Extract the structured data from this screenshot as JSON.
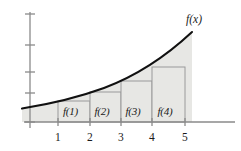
{
  "figure": {
    "curve_label": "f(x)",
    "colors": {
      "fill": "#e7e7e4",
      "curve": "#111111",
      "axis": "#8a8a8a",
      "rect_border": "#9a9a9a",
      "text": "#1a1a1a",
      "background": "#ffffff"
    }
  },
  "axes": {
    "x_axis": {
      "y_px": 122,
      "x_start_px": 24,
      "x_end_px": 235
    },
    "y_axis": {
      "x_px": 30,
      "y_start_px": 12,
      "y_end_px": 128
    },
    "x_ticks": [
      {
        "label": "1",
        "x_px": 58
      },
      {
        "label": "2",
        "x_px": 90
      },
      {
        "label": "3",
        "x_px": 121
      },
      {
        "label": "4",
        "x_px": 152
      },
      {
        "label": "5",
        "x_px": 185
      }
    ],
    "y_ticks_px": [
      14,
      45,
      72,
      93,
      122
    ]
  },
  "rectangles": [
    {
      "label": "f(1)",
      "x_left_px": 58,
      "x_right_px": 90,
      "top_px": 101
    },
    {
      "label": "f(2)",
      "x_left_px": 90,
      "x_right_px": 121,
      "top_px": 92
    },
    {
      "label": "f(3)",
      "x_left_px": 121,
      "x_right_px": 152,
      "top_px": 81
    },
    {
      "label": "f(4)",
      "x_left_px": 152,
      "x_right_px": 185,
      "top_px": 67
    }
  ],
  "chart_data": {
    "type": "area",
    "xlabel": "",
    "ylabel": "",
    "xlim": [
      0,
      5.8
    ],
    "ylim": [
      0,
      5
    ],
    "grid": false,
    "legend": "none",
    "annotations": [
      "f(x)"
    ],
    "x_tick_labels": [
      "1",
      "2",
      "3",
      "4",
      "5"
    ],
    "y_tick_labels": [
      "",
      "",
      "",
      "",
      ""
    ],
    "categories": [
      "f(1)",
      "f(2)",
      "f(3)",
      "f(4)"
    ],
    "bar_intervals": [
      [
        1,
        2
      ],
      [
        2,
        3
      ],
      [
        3,
        4
      ],
      [
        4,
        5
      ]
    ],
    "values": [
      1.1,
      1.55,
      2.1,
      2.85
    ],
    "series": [
      {
        "name": "f(x)",
        "type": "line",
        "x": [
          0.0,
          0.5,
          1.0,
          1.5,
          2.0,
          2.5,
          3.0,
          3.5,
          4.0,
          4.5,
          5.0
        ],
        "y": [
          0.72,
          0.82,
          0.98,
          1.2,
          1.5,
          1.8,
          2.12,
          2.52,
          2.96,
          3.45,
          4.0
        ]
      },
      {
        "name": "rectangles (right endpoints)",
        "type": "bar",
        "x": [
          "f(1)",
          "f(2)",
          "f(3)",
          "f(4)"
        ],
        "y": [
          1.1,
          1.55,
          2.1,
          2.85
        ]
      }
    ]
  },
  "paths": {
    "curve_d": "M 22,108.5 C 50,104 78,97.5 104,88 C 132,77.5 162,60 192,32",
    "fill_d": "M 22,108.5 C 50,104 78,97.5 104,88 C 132,77.5 162,60 192,32 L 192,122 L 22,122 Z"
  }
}
